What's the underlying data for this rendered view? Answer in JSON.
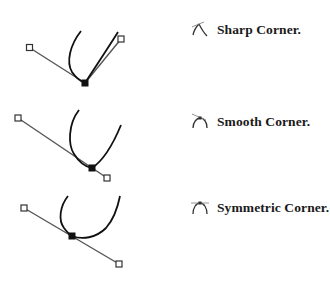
{
  "colors": {
    "curve": "#111111",
    "handle_line": "#555555",
    "anchor_fill": "#111111",
    "handle_fill": "#ffffff",
    "text": "#1a1a1a",
    "icon": "#333333"
  },
  "items": [
    {
      "icon": "sharp-corner-icon",
      "label": "Sharp Corner.",
      "anchor": [
        85,
        83
      ],
      "handle_left": [
        30,
        48
      ],
      "handle_right": [
        121,
        39
      ]
    },
    {
      "icon": "smooth-corner-icon",
      "label": "Smooth Corner.",
      "anchor": [
        92,
        168
      ],
      "handle_left": [
        18,
        118
      ],
      "handle_right": [
        107,
        178
      ]
    },
    {
      "icon": "symmetric-corner-icon",
      "label": "Symmetric Corner.",
      "anchor": [
        72,
        236
      ],
      "handle_left": [
        24,
        208
      ],
      "handle_right": [
        119,
        264
      ]
    }
  ]
}
